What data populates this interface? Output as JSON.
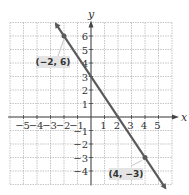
{
  "chart_data": {
    "type": "line",
    "title": "",
    "xlabel": "x",
    "ylabel": "y",
    "xlim": [
      -6,
      6
    ],
    "ylim": [
      -5,
      7
    ],
    "grid": true,
    "x_ticks": [
      -5,
      -4,
      -3,
      -2,
      -1,
      1,
      2,
      3,
      4,
      5
    ],
    "y_ticks": [
      -4,
      -3,
      -2,
      -1,
      1,
      2,
      3,
      4,
      5,
      6
    ],
    "x_tick_labels": [
      "−5",
      "−4",
      "−3",
      "−2",
      "−1",
      "1",
      "2",
      "3",
      "4",
      "5"
    ],
    "y_tick_labels": [
      "−4",
      "−3",
      "−2",
      "−1",
      "1",
      "2",
      "3",
      "4",
      "5",
      "6"
    ],
    "series": [
      {
        "name": "line",
        "equation": "y = -1.5x + 3",
        "slope": -1.5,
        "intercept": 3,
        "color": "#5a5a5a",
        "points": [
          {
            "x": -2,
            "y": 6
          },
          {
            "x": 4,
            "y": -3
          }
        ]
      }
    ],
    "annotations": [
      {
        "text": "(−2, 6)",
        "x": -2,
        "y": 6
      },
      {
        "text": "(4, −3)",
        "x": 4,
        "y": -3
      }
    ]
  },
  "colors": {
    "grid": "#b8b8b8",
    "axis": "#444444",
    "line": "#5a5a5a",
    "label_bg": "#e4e4e4"
  }
}
